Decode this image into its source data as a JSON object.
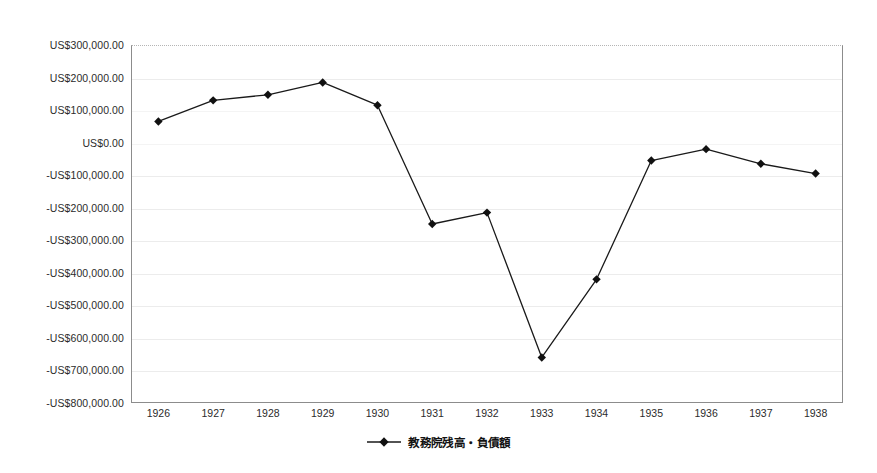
{
  "chart_data": {
    "type": "line",
    "title": "",
    "xlabel": "",
    "ylabel": "",
    "categories": [
      "1926",
      "1927",
      "1928",
      "1929",
      "1930",
      "1931",
      "1932",
      "1933",
      "1934",
      "1935",
      "1936",
      "1937",
      "1938"
    ],
    "series": [
      {
        "name": "教務院残高・負債額",
        "values": [
          65000,
          130000,
          147000,
          185000,
          115000,
          -250000,
          -215000,
          -660000,
          -420000,
          -55000,
          -20000,
          -65000,
          -95000
        ]
      }
    ],
    "ylim": [
      -800000,
      300000
    ],
    "ytick_values": [
      300000,
      200000,
      100000,
      0,
      -100000,
      -200000,
      -300000,
      -400000,
      -500000,
      -600000,
      -700000,
      -800000
    ],
    "ytick_labels": [
      "US$300,000.00",
      "US$200,000.00",
      "US$100,000.00",
      "US$0.00",
      "-US$100,000.00",
      "-US$200,000.00",
      "-US$300,000.00",
      "-US$400,000.00",
      "-US$500,000.00",
      "-US$600,000.00",
      "-US$700,000.00",
      "-US$800,000.00"
    ],
    "grid": true,
    "legend_position": "bottom",
    "marker": "diamond",
    "line_color": "#1a1a1a",
    "marker_color": "#111111",
    "grid_color": "#ececec",
    "axis_color": "#8c8c8c",
    "background_color": "#ffffff"
  },
  "legend": {
    "entries": [
      {
        "label": "教務院残高・負債額",
        "marker_icon": "diamond-marker-icon"
      }
    ]
  }
}
